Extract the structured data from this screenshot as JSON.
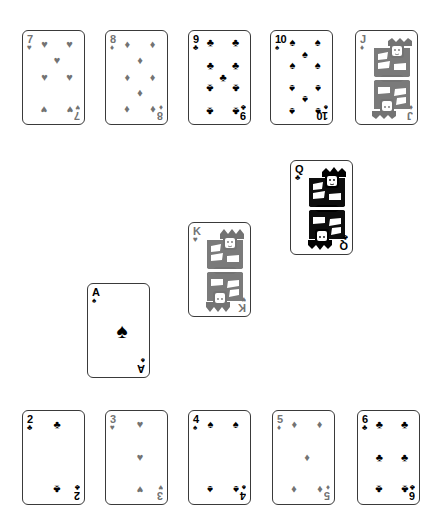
{
  "canvas": {
    "width": 439,
    "height": 509,
    "background": "#ffffff"
  },
  "palette": {
    "black_suit_ink": "#000000",
    "red_suit_ink": "#737373",
    "card_face": "#ffffff",
    "card_border": "#3a3a3a"
  },
  "suit_glyphs": {
    "spades": "♠",
    "hearts": "♥",
    "diamonds": "♦",
    "clubs": "♣"
  },
  "groups": [
    {
      "name": "top-row",
      "label": "Top row of five cards"
    },
    {
      "name": "diagonal",
      "label": "Diagonal run of three cards"
    },
    {
      "name": "bottom-row",
      "label": "Bottom row of five cards"
    }
  ],
  "cards": [
    {
      "id": "card-7-hearts",
      "rank": "7",
      "suit": "hearts",
      "suit_glyph": "♥",
      "suit_name": "hearts",
      "ink": "gray",
      "group": "top-row",
      "x": 22,
      "y": 30,
      "kind": "pip",
      "pip_count": 7
    },
    {
      "id": "card-8-diamonds",
      "rank": "8",
      "suit": "diamonds",
      "suit_glyph": "♦",
      "suit_name": "diamonds",
      "ink": "gray",
      "group": "top-row",
      "x": 105,
      "y": 30,
      "kind": "pip",
      "pip_count": 8
    },
    {
      "id": "card-9-clubs",
      "rank": "9",
      "suit": "clubs",
      "suit_glyph": "♣",
      "suit_name": "clubs",
      "ink": "black",
      "group": "top-row",
      "x": 188,
      "y": 30,
      "kind": "pip",
      "pip_count": 9
    },
    {
      "id": "card-10-spades",
      "rank": "10",
      "suit": "spades",
      "suit_glyph": "♠",
      "suit_name": "spades",
      "ink": "black",
      "group": "top-row",
      "x": 270,
      "y": 30,
      "kind": "pip",
      "pip_count": 10
    },
    {
      "id": "card-J-diamonds",
      "rank": "J",
      "suit": "diamonds",
      "suit_glyph": "♦",
      "suit_name": "diamonds",
      "ink": "gray",
      "group": "top-row",
      "x": 355,
      "y": 30,
      "kind": "court",
      "court": "jack"
    },
    {
      "id": "card-Q-clubs",
      "rank": "Q",
      "suit": "clubs",
      "suit_glyph": "♣",
      "suit_name": "clubs",
      "ink": "black",
      "group": "diagonal",
      "x": 290,
      "y": 160,
      "kind": "court",
      "court": "queen"
    },
    {
      "id": "card-K-hearts",
      "rank": "K",
      "suit": "hearts",
      "suit_glyph": "♥",
      "suit_name": "hearts",
      "ink": "gray",
      "group": "diagonal",
      "x": 188,
      "y": 222,
      "kind": "court",
      "court": "king"
    },
    {
      "id": "card-A-spades",
      "rank": "A",
      "suit": "spades",
      "suit_glyph": "♠",
      "suit_name": "spades",
      "ink": "black",
      "group": "diagonal",
      "x": 87,
      "y": 283,
      "kind": "pip",
      "pip_count": 1
    },
    {
      "id": "card-2-clubs",
      "rank": "2",
      "suit": "clubs",
      "suit_glyph": "♣",
      "suit_name": "clubs",
      "ink": "black",
      "group": "bottom-row",
      "x": 22,
      "y": 410,
      "kind": "pip",
      "pip_count": 2
    },
    {
      "id": "card-3-hearts",
      "rank": "3",
      "suit": "hearts",
      "suit_glyph": "♥",
      "suit_name": "hearts",
      "ink": "gray",
      "group": "bottom-row",
      "x": 105,
      "y": 410,
      "kind": "pip",
      "pip_count": 3
    },
    {
      "id": "card-4-spades",
      "rank": "4",
      "suit": "spades",
      "suit_glyph": "♠",
      "suit_name": "spades",
      "ink": "black",
      "group": "bottom-row",
      "x": 188,
      "y": 410,
      "kind": "pip",
      "pip_count": 4
    },
    {
      "id": "card-5-diamonds",
      "rank": "5",
      "suit": "diamonds",
      "suit_glyph": "♦",
      "suit_name": "diamonds",
      "ink": "gray",
      "group": "bottom-row",
      "x": 272,
      "y": 410,
      "kind": "pip",
      "pip_count": 5
    },
    {
      "id": "card-6-clubs",
      "rank": "6",
      "suit": "clubs",
      "suit_glyph": "♣",
      "suit_name": "clubs",
      "ink": "black",
      "group": "bottom-row",
      "x": 357,
      "y": 410,
      "kind": "pip",
      "pip_count": 6
    }
  ]
}
